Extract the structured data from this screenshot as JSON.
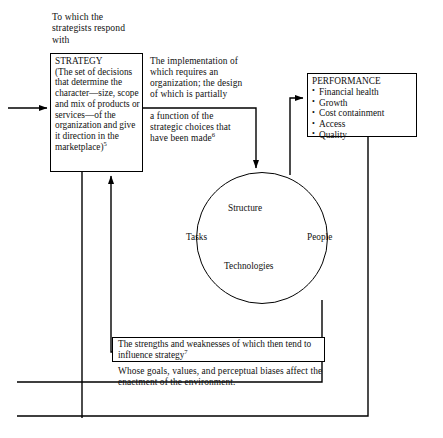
{
  "diagram": {
    "captions": {
      "top": "To which the strategists respond with",
      "implementation": "The implementation of which requires an organization; the design of which is partially",
      "function": "a function of the strategic choices that have been made",
      "function_note": "6",
      "goals": "Whose goals, values, and perceptual biases affect the enactment of the environment."
    },
    "strategy_box": {
      "title": "STRATEGY",
      "body": "(The set of decisions that determine the character—size, scope and mix of products or services—of the organization and give it direction in the marketplace)",
      "note": "5"
    },
    "performance_box": {
      "title": "PERFORMANCE",
      "items": [
        "Financial health",
        "Growth",
        "Cost containment",
        "Access",
        "Quality"
      ]
    },
    "circle": {
      "nodes": {
        "top": "Structure",
        "left": "Tasks",
        "right": "People",
        "bottom": "Technologies"
      }
    },
    "strengths_box": {
      "text": "The strengths and weaknesses of which then tend to influence strategy",
      "note": "7"
    },
    "style": {
      "line_color": "#000000",
      "background": "#ffffff",
      "text_color": "#111111"
    }
  }
}
